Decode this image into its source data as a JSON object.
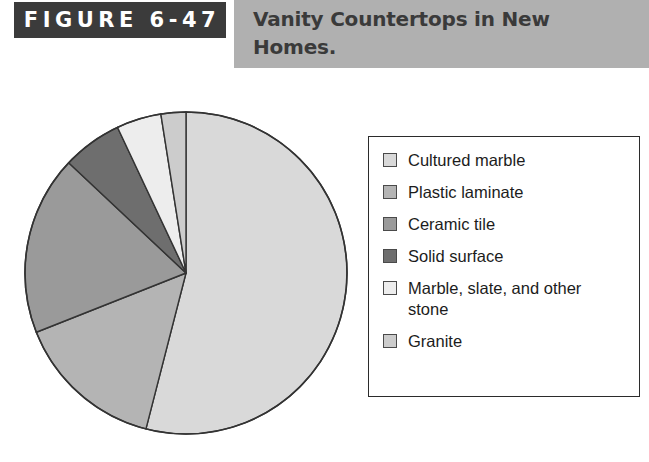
{
  "header": {
    "figure_tag": "FIGURE 6-47",
    "title": "Vanity Countertops in New Homes.",
    "tag_background": "#3b3b3b",
    "tag_text_color": "#ffffff",
    "band_background": "#b0b0b0",
    "title_text_color": "#3a3a3a"
  },
  "legend": {
    "items": [
      {
        "label": "Cultured marble",
        "color": "#d9d9d9"
      },
      {
        "label": "Plastic laminate",
        "color": "#b4b4b4"
      },
      {
        "label": "Ceramic tile",
        "color": "#9a9a9a"
      },
      {
        "label": "Solid surface",
        "color": "#6e6e6e"
      },
      {
        "label": "Marble, slate, and other stone",
        "color": "#ededed"
      },
      {
        "label": "Granite",
        "color": "#cccccc"
      }
    ]
  },
  "chart_data": {
    "type": "pie",
    "title": "Vanity Countertops in New Homes.",
    "start_angle_deg": 0,
    "direction": "clockwise",
    "legend_position": "right",
    "outline_color": "#333333",
    "categories": [
      "Cultured marble",
      "Plastic laminate",
      "Ceramic tile",
      "Solid surface",
      "Marble, slate, and other stone",
      "Granite"
    ],
    "values": [
      54,
      15,
      18,
      6,
      4.5,
      2.5
    ],
    "colors": [
      "#d9d9d9",
      "#b4b4b4",
      "#9a9a9a",
      "#6e6e6e",
      "#ededed",
      "#cccccc"
    ],
    "units": "percent"
  }
}
